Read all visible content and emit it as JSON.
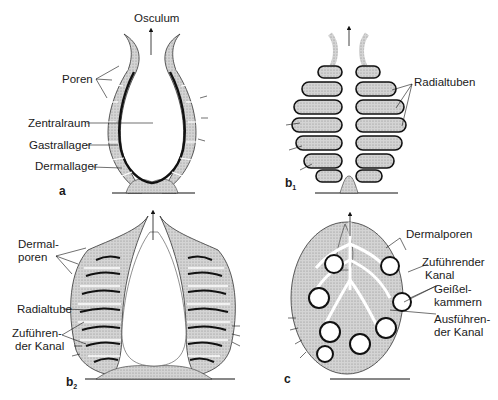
{
  "figure": {
    "panels": [
      {
        "id": "a",
        "label": "a",
        "subscript": "",
        "labels": {
          "osculum": "Osculum",
          "poren": "Poren",
          "zentralraum": "Zentralraum",
          "gastrallager": "Gastrallager",
          "dermallager": "Dermallager"
        }
      },
      {
        "id": "b1",
        "label": "b",
        "subscript": "1",
        "labels": {
          "radialtuben": "Radialtuben"
        }
      },
      {
        "id": "b2",
        "label": "b",
        "subscript": "2",
        "labels": {
          "dermalporen_line1": "Dermal-",
          "dermalporen_line2": "poren",
          "radialtube": "Radialtube",
          "zufuehrender_line1": "Zuführen-",
          "zufuehrender_line2": "der Kanal"
        }
      },
      {
        "id": "c",
        "label": "c",
        "subscript": "",
        "labels": {
          "dermalporen": "Dermalporen",
          "zufuehrender_line1": "Zuführender",
          "zufuehrender_line2": "Kanal",
          "geissel_line1": "Geißel-",
          "geissel_line2": "kammern",
          "ausfuehrender_line1": "Ausführen-",
          "ausfuehrender_line2": "der Kanal"
        }
      }
    ],
    "colors": {
      "stipple": "#c8c8c8",
      "stipple_dark": "#9a9a9a",
      "ink": "#111111",
      "background": "#ffffff"
    }
  }
}
